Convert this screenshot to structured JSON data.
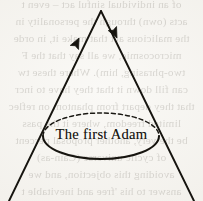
{
  "figure": {
    "name": "cone-with-upward-arrows-diagram",
    "width": 203,
    "height": 201,
    "background_color": "#f5f3ef",
    "ink_color": "#16140f",
    "label": "The first Adam"
  },
  "cone": {
    "apex": {
      "x": 101,
      "y": 11
    },
    "left_side": {
      "x1": 101,
      "y1": 11,
      "x2": 9,
      "y2": 201
    },
    "right_side": {
      "x1": 101,
      "y1": 11,
      "x2": 194,
      "y2": 201
    },
    "stroke_width": 1.9
  },
  "arrows": [
    {
      "name": "left-arrowhead",
      "tip": {
        "x": 79,
        "y": 38
      },
      "direction": "up-right-toward-apex",
      "angle_deg": -64
    },
    {
      "name": "right-arrowhead",
      "tip": {
        "x": 117,
        "y": 38
      },
      "direction": "up-left-toward-apex",
      "angle_deg": 64
    }
  ],
  "base_ellipse": {
    "center": {
      "x": 101,
      "y": 136
    },
    "radius_x": 58,
    "radius_y": 23,
    "front_arc_style": "solid",
    "back_arc_style": "dashed",
    "dash_pattern": "4 3"
  },
  "bleed_through": {
    "description": "faint mirrored show-through text from the reverse side of the page",
    "opacity": 0.3,
    "lines": [
      "of an individual sinful act – even t",
      "acts (own) through the personality in",
      "the malicious act that make it, in orde",
      "microcosmic, we all say that the F",
      "two-phrasing, him). Where these tw",
      "can fill down it that they have to incr",
      "that they depart from phantom on reflec",
      "limited freedom, where it the pass",
      "be the very, another proposal percent",
      "of cyclic universe (Cain-as)",
      "avoiding this objection, and we",
      "answer to his 'free and inevitable t"
    ]
  }
}
